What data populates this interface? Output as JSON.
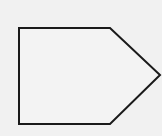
{
  "diagram": {
    "background": "#f1f1f1",
    "shape": {
      "type": "pentagon-arrow",
      "stroke": "#1a1a1a",
      "stroke_width": 2,
      "fill": "#f3f3f3",
      "points": "19,28 110,28 160,75 110,124 19,124"
    }
  }
}
